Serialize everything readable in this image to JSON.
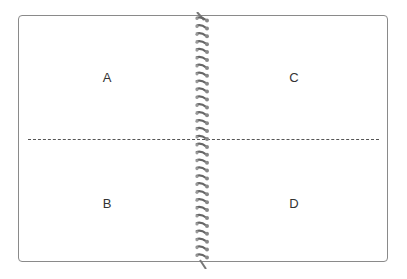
{
  "diagram": {
    "type": "spiral-notebook-quadrants",
    "quadrants": [
      {
        "id": "top-left",
        "label": "A"
      },
      {
        "id": "bottom-left",
        "label": "B"
      },
      {
        "id": "top-right",
        "label": "C"
      },
      {
        "id": "bottom-right",
        "label": "D"
      }
    ],
    "divider": "dashed horizontal fold line",
    "binding": "spiral"
  }
}
